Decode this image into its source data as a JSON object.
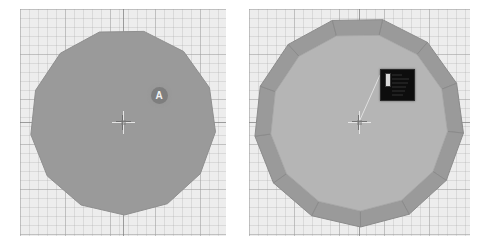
{
  "app": {
    "title": "3D Viewport Comparison",
    "background_color": "#ffffff"
  },
  "viewport_common": {
    "background_color": "#ededed",
    "grid_minor_color": "#afafaf",
    "grid_major_color": "#a0a0a0",
    "axis_color": "#787878",
    "grid_minor_spacing_px": 9,
    "grid_major_spacing_px": 45
  },
  "panels": [
    {
      "id": "left",
      "name": "viewport-left",
      "label": "Left viewport",
      "x": 20,
      "y": 9,
      "width": 206,
      "height": 227,
      "object": {
        "name": "flat-ngon",
        "type": "polygon",
        "sides": 13,
        "fill_color": "#9a9a9a",
        "stroke_color": "#8f8f8f",
        "center_x": 103,
        "center_y": 113,
        "radius": 93,
        "rotation_deg": 13
      },
      "marker": {
        "name": "marker-a",
        "label": "A",
        "x": 139,
        "y": 86,
        "diameter": 17,
        "fill_color": "#7e7e7e",
        "text_color": "#f2f2f2"
      },
      "cursor_3d": {
        "name": "cursor-3d",
        "x": 103,
        "y": 113
      }
    },
    {
      "id": "right",
      "name": "viewport-right",
      "label": "Right viewport",
      "x": 249,
      "y": 9,
      "width": 221,
      "height": 227,
      "object": {
        "name": "beveled-ngon",
        "type": "polygon-beveled",
        "sides": 13,
        "inner_fill_color": "#b5b5b5",
        "bevel_fill_color": "#9a9a9a",
        "bevel_stroke_color": "#8b8b8b",
        "inner_stroke_color": "#a8a8a8",
        "center_x": 110,
        "center_y": 113,
        "outer_radius": 105,
        "inner_radius": 89,
        "rotation_deg": 13
      },
      "black_panel": {
        "name": "black-info-panel",
        "x": 131,
        "y": 60,
        "width": 33,
        "height": 30,
        "background_color": "#0d0d0d",
        "border_color": "#2b2b2b",
        "accent_bar_color": "#d8d8d8",
        "row_count": 6
      },
      "leader_line": {
        "name": "leader-line",
        "from_x": 110,
        "from_y": 113,
        "to_x": 131,
        "to_y": 66,
        "color": "#e0e0e0"
      },
      "cursor_3d": {
        "name": "cursor-3d",
        "x": 110,
        "y": 113
      }
    }
  ]
}
